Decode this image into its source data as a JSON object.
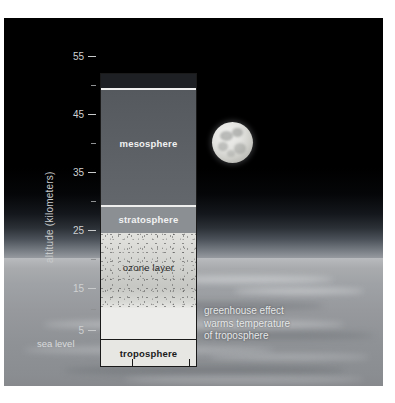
{
  "diagram": {
    "axis": {
      "title": "altitude (kilometers)",
      "sea_level_label": "sea level",
      "tick_labels": [
        "55",
        "45",
        "35",
        "25",
        "15",
        "5"
      ],
      "tick_values": [
        55,
        45,
        35,
        25,
        15,
        5
      ],
      "minor_tick_values": [
        50,
        40,
        30,
        20,
        10
      ],
      "units": "kilometers",
      "range": [
        0,
        57
      ]
    },
    "layers": [
      {
        "id": "space-cap",
        "label": "",
        "from_km": 55.5,
        "to_km": 57.0,
        "color": "#1e2024",
        "label_style": "none"
      },
      {
        "id": "mesosphere",
        "label": "mesosphere",
        "from_km": 33.0,
        "to_km": 54.5,
        "color": "#5c6065",
        "label_style": "light"
      },
      {
        "id": "stratosphere",
        "label": "stratosphere",
        "from_km": 26.5,
        "to_km": 33.0,
        "color": "#8b8f93",
        "label_style": "light"
      },
      {
        "id": "ozone-layer",
        "label": "ozone layer",
        "from_km": 16.5,
        "to_km": 26.5,
        "color": "#d2d3cf",
        "label_style": "plain"
      },
      {
        "id": "upper-clear",
        "label": "",
        "from_km": 11.5,
        "to_km": 16.5,
        "color": "#ecece9",
        "label_style": "none"
      },
      {
        "id": "troposphere",
        "label": "troposphere",
        "from_km": 0.0,
        "to_km": 11.0,
        "color": "#e6e6e2",
        "label_style": "dark"
      }
    ],
    "annotation": {
      "lines": [
        "greenhouse effect",
        "warms temperature",
        "of troposphere"
      ]
    },
    "scene": {
      "moon_label": "moon",
      "sky_label": "night sky",
      "clouds_label": "earth cloud deck"
    },
    "colors": {
      "background": "#000000",
      "mesosphere": "#5c6065",
      "stratosphere": "#8b8f93",
      "ozone": "#d2d3cf",
      "troposphere": "#e6e6e2",
      "axis_text": "#cfd1d2",
      "annotation_text": "#e7e9ea",
      "border": "#1a1a1a"
    }
  }
}
